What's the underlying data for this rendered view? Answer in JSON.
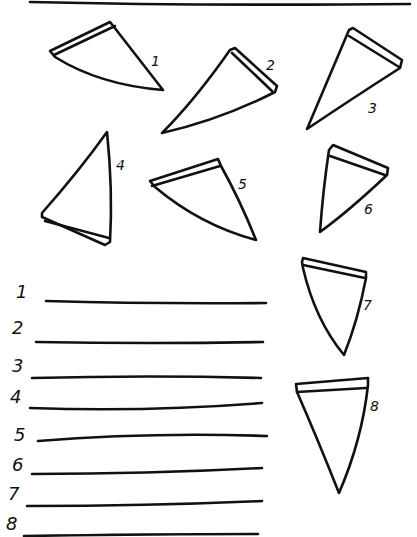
{
  "worksheet": {
    "top_rule": true,
    "slices": [
      {
        "id": 1,
        "label": "1"
      },
      {
        "id": 2,
        "label": "2"
      },
      {
        "id": 3,
        "label": "3"
      },
      {
        "id": 4,
        "label": "4"
      },
      {
        "id": 5,
        "label": "5"
      },
      {
        "id": 6,
        "label": "6"
      },
      {
        "id": 7,
        "label": "7"
      },
      {
        "id": 8,
        "label": "8"
      }
    ],
    "answer_lines": [
      {
        "label": "1"
      },
      {
        "label": "2"
      },
      {
        "label": "3"
      },
      {
        "label": "4"
      },
      {
        "label": "5"
      },
      {
        "label": "6"
      },
      {
        "label": "7"
      },
      {
        "label": "8"
      }
    ]
  }
}
